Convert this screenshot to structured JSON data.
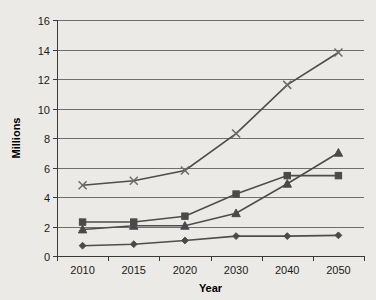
{
  "chart_data": {
    "type": "line",
    "title": "",
    "xlabel": "Year",
    "ylabel": "Millions",
    "categories": [
      "2010",
      "2015",
      "2020",
      "2030",
      "2040",
      "2050"
    ],
    "ylim": [
      0,
      16
    ],
    "y_ticks": [
      0,
      2,
      4,
      6,
      8,
      10,
      12,
      14,
      16
    ],
    "y_tick_labels": [
      "0",
      "2",
      "4",
      "6",
      "8",
      "10",
      "12",
      "14",
      "16"
    ],
    "grid": true,
    "grid_axis": "y",
    "legend": false,
    "legend_position": "none",
    "series": [
      {
        "name": "series-x",
        "marker": "x",
        "color": "#6a6a6a",
        "values": [
          4.8,
          5.1,
          5.8,
          8.3,
          11.6,
          13.8
        ]
      },
      {
        "name": "series-square",
        "marker": "square",
        "color": "#4a4a4a",
        "values": [
          2.3,
          2.3,
          2.7,
          4.2,
          5.45,
          5.45
        ]
      },
      {
        "name": "series-triangle",
        "marker": "triangle",
        "color": "#4a4a4a",
        "values": [
          1.8,
          2.05,
          2.05,
          2.9,
          4.9,
          7.0
        ]
      },
      {
        "name": "series-diamond",
        "marker": "diamond",
        "color": "#4a4a4a",
        "values": [
          0.7,
          0.8,
          1.05,
          1.35,
          1.35,
          1.4
        ]
      }
    ]
  }
}
